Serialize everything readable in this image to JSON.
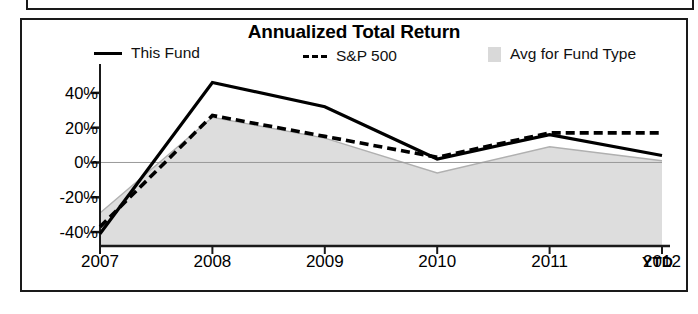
{
  "chart_data": {
    "type": "line",
    "title": "Annualized Total Return",
    "xlabel": "",
    "ylabel": "",
    "categories": [
      "2007",
      "2008",
      "2009",
      "2010",
      "2011",
      "2012"
    ],
    "x_axis_suffix_label": "YTD",
    "ytick_labels": [
      "40%",
      "20%",
      "0%",
      "-20%",
      "-40%"
    ],
    "ytick_values": [
      40,
      20,
      0,
      -20,
      -40
    ],
    "ylim": [
      -48,
      52
    ],
    "grid": false,
    "zero_line": true,
    "legend_position": "top",
    "series": [
      {
        "name": "This Fund",
        "style": "solid",
        "color": "#000000",
        "values": [
          -41,
          46,
          32,
          2,
          16,
          4
        ]
      },
      {
        "name": "S&P 500",
        "style": "dashed",
        "color": "#000000",
        "values": [
          -37,
          27,
          15,
          3,
          17,
          17
        ]
      },
      {
        "name": "Avg for Fund Type",
        "style": "area",
        "color": "#d2d2d2",
        "values": [
          -29,
          26,
          14,
          -6,
          9,
          1
        ]
      }
    ]
  },
  "legend": {
    "items": [
      {
        "label": "This Fund",
        "marker": "solid-line-swatch"
      },
      {
        "label": "S&P 500",
        "marker": "dashed-line-swatch"
      },
      {
        "label": "Avg for Fund Type",
        "marker": "area-swatch"
      }
    ]
  }
}
